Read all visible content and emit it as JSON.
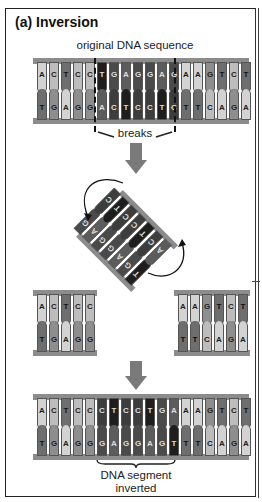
{
  "figure": {
    "title": "(a) Inversion",
    "original_label": "original DNA sequence",
    "breaks_label": "breaks",
    "inverted_label_line1": "DNA segment",
    "inverted_label_line2": "inverted"
  },
  "original": {
    "top": [
      "A",
      "C",
      "T",
      "C",
      "C",
      "T",
      "G",
      "A",
      "G",
      "G",
      "A",
      "G",
      "A",
      "A",
      "G",
      "T",
      "C",
      "T"
    ],
    "bottom": [
      "T",
      "G",
      "A",
      "G",
      "G",
      "A",
      "C",
      "T",
      "C",
      "C",
      "T",
      "C",
      "T",
      "T",
      "C",
      "A",
      "G",
      "A"
    ],
    "segment_start": 5,
    "segment_end": 11
  },
  "excised_segment": {
    "top": [
      "T",
      "G",
      "A",
      "G",
      "G",
      "A",
      "G"
    ],
    "bottom": [
      "A",
      "C",
      "T",
      "C",
      "C",
      "T",
      "C"
    ]
  },
  "left_fragment": {
    "top": [
      "A",
      "C",
      "T",
      "C",
      "C"
    ],
    "bottom": [
      "T",
      "G",
      "A",
      "G",
      "G"
    ]
  },
  "right_fragment": {
    "top": [
      "A",
      "A",
      "G",
      "T",
      "C",
      "T"
    ],
    "bottom": [
      "T",
      "T",
      "C",
      "A",
      "G",
      "A"
    ]
  },
  "result": {
    "top": [
      "A",
      "C",
      "T",
      "C",
      "C",
      "C",
      "T",
      "C",
      "C",
      "T",
      "G",
      "A",
      "A",
      "A",
      "G",
      "T",
      "C",
      "T"
    ],
    "bottom": [
      "T",
      "G",
      "A",
      "G",
      "G",
      "G",
      "A",
      "G",
      "G",
      "A",
      "G",
      "T",
      "T",
      "T",
      "C",
      "A",
      "G",
      "A"
    ],
    "segment_start": 5,
    "segment_end": 11
  },
  "colors": {
    "A": "#d3d3d3",
    "C": "#bdbdbd",
    "G": "#8e8e8e",
    "T": "#6e6e6e",
    "rail": "#8c8c8c",
    "arrow": "#7a7a7a"
  }
}
